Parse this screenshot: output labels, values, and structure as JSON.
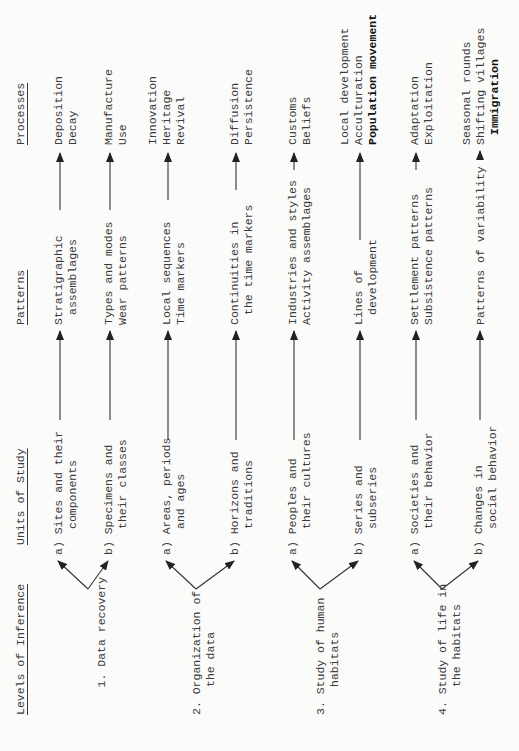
{
  "headers": {
    "levels": "Levels of Inference",
    "units": "Units of Study",
    "patterns": "Patterns",
    "processes": "Processes"
  },
  "levels": [
    {
      "label_line1": "1. Data recovery",
      "label_line2": "",
      "units": [
        {
          "marker": "a)",
          "line1": "Sites and their",
          "line2": "components",
          "patterns": [
            "Stratigraphic",
            "assemblages"
          ],
          "processes": [
            "Deposition",
            "Decay"
          ]
        },
        {
          "marker": "b)",
          "line1": "Specimens and",
          "line2": "their classes",
          "patterns": [
            "Types and modes",
            "Wear patterns"
          ],
          "processes": [
            "Manufacture",
            "Use"
          ]
        }
      ]
    },
    {
      "label_line1": "2. Organization of",
      "label_line2": "the data",
      "units": [
        {
          "marker": "a)",
          "line1": "Areas, periods",
          "line2": "and ages",
          "patterns": [
            "Local sequences",
            "Time markers"
          ],
          "processes": [
            "Innovation",
            "Heritage",
            "Revival"
          ]
        },
        {
          "marker": "b)",
          "line1": "Horizons and",
          "line2": "traditions",
          "patterns": [
            "Continuities in",
            "the time markers"
          ],
          "processes": [
            "Diffusion",
            "Persistence"
          ]
        }
      ]
    },
    {
      "label_line1": "3. Study of human",
      "label_line2": "habitats",
      "units": [
        {
          "marker": "a)",
          "line1": "Peoples and",
          "line2": "their cultures",
          "patterns": [
            "Industries and styles",
            "Activity assemblages"
          ],
          "processes": [
            "Customs",
            "Beliefs"
          ]
        },
        {
          "marker": "b)",
          "line1": "Series and",
          "line2": "subseries",
          "patterns": [
            "Lines of",
            "development"
          ],
          "processes": [
            "Local development",
            "Acculturation",
            "Population movement"
          ],
          "bold_process_index": 2
        }
      ]
    },
    {
      "label_line1": "4. Study of life in",
      "label_line2": "the habitats",
      "units": [
        {
          "marker": "a)",
          "line1": "Societies and",
          "line2": "their behavior",
          "patterns": [
            "Settlement patterns",
            "Subsistence patterns"
          ],
          "processes": [
            "Adaptation",
            "Exploitation"
          ]
        },
        {
          "marker": "b)",
          "line1": "Changes in",
          "line2": "social behavior",
          "patterns": [
            "Patterns of variability"
          ],
          "processes": [
            "Seasonal rounds",
            "Shifting villages",
            "Immigration"
          ],
          "bold_process_index": 2
        }
      ]
    }
  ]
}
